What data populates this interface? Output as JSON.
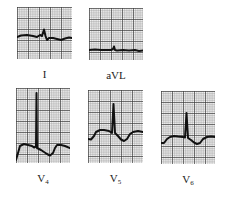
{
  "figure": {
    "grid_minor_color": "#8a8a8a",
    "grid_major_color": "#3a3a3a",
    "trace_color": "#111111",
    "paper_color": "#f4f4f4"
  },
  "leads": [
    {
      "id": "I",
      "label": "I",
      "sub": "",
      "x": 17,
      "y": 7,
      "w": 55,
      "h": 52,
      "label_x": 17,
      "label_y": 68,
      "trace": "0,30 4,28.5 10,28 16,29 20,30 23,28 25,29 27,22.5 28.5,29 30,33 32,31 36,31 40,32 44,33 48,31.5 52,30.5 55,31"
    },
    {
      "id": "aVL",
      "label": "aVL",
      "sub": "",
      "x": 89,
      "y": 8,
      "w": 54,
      "h": 52,
      "label_x": 89,
      "label_y": 69,
      "trace": "0,42 6,41.5 12,42 18,42 22,42 24,41 25,38.5 26,42 28,42.5 34,42 40,42.5 46,42 50,43 54,42.5"
    },
    {
      "id": "V4",
      "label": "V",
      "sub": "4",
      "x": 16,
      "y": 88,
      "w": 54,
      "h": 75,
      "label_x": 16,
      "label_y": 172,
      "trace": "0,72 2,65 4,58 8,56 12,57 16,58 18,59.5 20,58.5 20.5,5 21,60 25,62 28,64 31,66 34,67.5 37,65 39,60 41,57 45,57 49,58 54,60"
    },
    {
      "id": "V5",
      "label": "V",
      "sub": "5",
      "x": 88,
      "y": 90,
      "w": 55,
      "h": 73,
      "label_x": 88,
      "label_y": 172,
      "trace": "0,49 3,49.5 6,46 8,42 12,40 16,40 21,41 24,43 25.5,14 27,43 30,46 33,49.5 36,51 39,49 42,44 45,42 50,41 55,42"
    },
    {
      "id": "V6",
      "label": "V",
      "sub": "6",
      "x": 161,
      "y": 91,
      "w": 54,
      "h": 73,
      "label_x": 161,
      "label_y": 173,
      "trace": "0,52 3,52 6,48 9,46 13,45 17,45.5 22,46 24,46.5 25.5,22 27,47 30,49 33,51.5 36,53 39,52 42,48 46,46 50,45.5 54,46"
    }
  ]
}
